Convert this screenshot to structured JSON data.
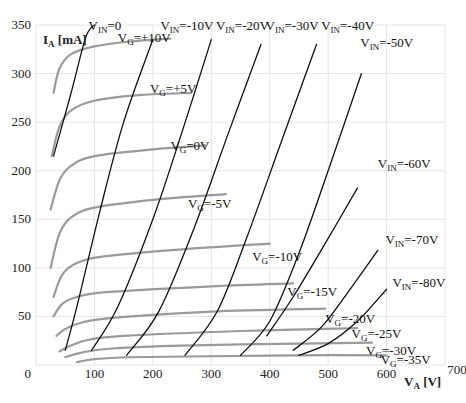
{
  "chart_data": {
    "type": "line",
    "title": "",
    "xlabel": "VA [V]",
    "ylabel": "IA [mA]",
    "xlim": [
      0,
      700
    ],
    "ylim": [
      0,
      350
    ],
    "x_ticks": [
      0,
      100,
      200,
      300,
      400,
      500,
      600,
      700
    ],
    "y_ticks": [
      0,
      50,
      100,
      150,
      200,
      250,
      300,
      350
    ],
    "grid": true,
    "legend": "inline labels",
    "series_groups": {
      "VG_curves": {
        "description": "Anode characteristic curves at constant grid voltage (gray)",
        "color": "#9a9a9a",
        "series": [
          {
            "name": "VG=+10V",
            "label_main": "V",
            "label_sub": "G",
            "label_rest": "=+10V",
            "label_pos": [
              140,
              333
            ],
            "points": [
              [
                30,
                280
              ],
              [
                40,
                305
              ],
              [
                60,
                320
              ],
              [
                100,
                328
              ],
              [
                160,
                333
              ],
              [
                230,
                336
              ]
            ]
          },
          {
            "name": "VG=+5V",
            "label_main": "V",
            "label_sub": "G",
            "label_rest": "=+5V",
            "label_pos": [
              195,
              280
            ],
            "points": [
              [
                27,
                215
              ],
              [
                40,
                245
              ],
              [
                60,
                262
              ],
              [
                100,
                272
              ],
              [
                180,
                278
              ],
              [
                265,
                280
              ]
            ]
          },
          {
            "name": "VG=0V",
            "label_main": "V",
            "label_sub": "G",
            "label_rest": "=0V",
            "label_pos": [
              230,
              221
            ],
            "points": [
              [
                25,
                160
              ],
              [
                40,
                190
              ],
              [
                60,
                205
              ],
              [
                100,
                215
              ],
              [
                200,
                222
              ],
              [
                290,
                226
              ]
            ]
          },
          {
            "name": "VG=-5V",
            "label_main": "V",
            "label_sub": "G",
            "label_rest": "=-5V",
            "label_pos": [
              260,
              162
            ],
            "points": [
              [
                25,
                100
              ],
              [
                40,
                135
              ],
              [
                60,
                152
              ],
              [
                100,
                162
              ],
              [
                200,
                170
              ],
              [
                325,
                176
              ]
            ]
          },
          {
            "name": "VG=-10V",
            "label_main": "V",
            "label_sub": "G",
            "label_rest": "=-10V",
            "label_pos": [
              370,
              107
            ],
            "points": [
              [
                30,
                70
              ],
              [
                45,
                93
              ],
              [
                70,
                105
              ],
              [
                120,
                112
              ],
              [
                250,
                119
              ],
              [
                400,
                125
              ]
            ]
          },
          {
            "name": "VG=-15V",
            "label_main": "V",
            "label_sub": "G",
            "label_rest": "=-15V",
            "label_pos": [
              430,
              71
            ],
            "points": [
              [
                30,
                50
              ],
              [
                45,
                63
              ],
              [
                70,
                70
              ],
              [
                120,
                75
              ],
              [
                300,
                81
              ],
              [
                440,
                84
              ]
            ]
          },
          {
            "name": "VG=-20V",
            "label_main": "V",
            "label_sub": "G",
            "label_rest": "=-20V",
            "label_pos": [
              495,
              43
            ],
            "points": [
              [
                35,
                30
              ],
              [
                50,
                37
              ],
              [
                80,
                44
              ],
              [
                140,
                49
              ],
              [
                300,
                55
              ],
              [
                495,
                58
              ]
            ]
          },
          {
            "name": "VG=-25V",
            "label_main": "V",
            "label_sub": "G",
            "label_rest": "=-25V",
            "label_pos": [
              540,
              28
            ],
            "points": [
              [
                40,
                14
              ],
              [
                60,
                20
              ],
              [
                90,
                26
              ],
              [
                150,
                30
              ],
              [
                350,
                35
              ],
              [
                550,
                38
              ]
            ]
          },
          {
            "name": "VG=-30V",
            "label_main": "V",
            "label_sub": "G",
            "label_rest": "=-30V",
            "label_pos": [
              565,
              10
            ],
            "points": [
              [
                50,
                8
              ],
              [
                80,
                13
              ],
              [
                130,
                17
              ],
              [
                250,
                20
              ],
              [
                450,
                22
              ],
              [
                575,
                23
              ]
            ]
          },
          {
            "name": "VG=-35V",
            "label_main": "V",
            "label_sub": "G",
            "label_rest": "=-35V",
            "label_pos": [
              590,
              1
            ],
            "points": [
              [
                70,
                3
              ],
              [
                100,
                6
              ],
              [
                160,
                8
              ],
              [
                300,
                9
              ],
              [
                450,
                10
              ],
              [
                600,
                10
              ]
            ]
          }
        ]
      },
      "VIN_lines": {
        "description": "Constant input voltage lines (black)",
        "color": "#111111",
        "series": [
          {
            "name": "VIN=0",
            "label_main": "V",
            "label_sub": "IN",
            "label_rest": "=0",
            "label_pos": [
              90,
              345
            ],
            "points": [
              [
                30,
                215
              ],
              [
                60,
                280
              ],
              [
                85,
                337
              ],
              [
                100,
                350
              ]
            ]
          },
          {
            "name": "VIN=-10V",
            "label_main": "V",
            "label_sub": "IN",
            "label_rest": "=-10V",
            "label_pos": [
              213,
              345
            ],
            "points": [
              [
                50,
                15
              ],
              [
                70,
                60
              ],
              [
                110,
                160
              ],
              [
                150,
                250
              ],
              [
                200,
                335
              ]
            ]
          },
          {
            "name": "VIN=-20V",
            "label_main": "V",
            "label_sub": "IN",
            "label_rest": "=-20V",
            "label_pos": [
              308,
              345
            ],
            "points": [
              [
                95,
                15
              ],
              [
                140,
                60
              ],
              [
                200,
                150
              ],
              [
                250,
                240
              ],
              [
                300,
                335
              ]
            ]
          },
          {
            "name": "VIN=-30V",
            "label_main": "V",
            "label_sub": "IN",
            "label_rest": "=-30V",
            "label_pos": [
              393,
              345
            ],
            "points": [
              [
                155,
                10
              ],
              [
                210,
                55
              ],
              [
                270,
                140
              ],
              [
                330,
                240
              ],
              [
                385,
                330
              ]
            ]
          },
          {
            "name": "VIN=-40V",
            "label_main": "V",
            "label_sub": "IN",
            "label_rest": "=-40V",
            "label_pos": [
              488,
              345
            ],
            "points": [
              [
                255,
                10
              ],
              [
                310,
                55
              ],
              [
                360,
                130
              ],
              [
                420,
                230
              ],
              [
                480,
                330
              ]
            ]
          },
          {
            "name": "VIN=-50V",
            "label_main": "V",
            "label_sub": "IN",
            "label_rest": "=-50V",
            "label_pos": [
              555,
              327
            ],
            "points": [
              [
                350,
                10
              ],
              [
                400,
                45
              ],
              [
                450,
                115
              ],
              [
                500,
                200
              ],
              [
                557,
                300
              ]
            ]
          },
          {
            "name": "VIN=-60V",
            "label_main": "V",
            "label_sub": "IN",
            "label_rest": "=-60V",
            "label_pos": [
              585,
              203
            ],
            "points": [
              [
                395,
                30
              ],
              [
                440,
                70
              ],
              [
                490,
                120
              ],
              [
                550,
                182
              ]
            ]
          },
          {
            "name": "VIN=-70V",
            "label_main": "V",
            "label_sub": "IN",
            "label_rest": "=-70V",
            "label_pos": [
              598,
              125
            ],
            "points": [
              [
                440,
                15
              ],
              [
                490,
                40
              ],
              [
                540,
                80
              ],
              [
                585,
                118
              ]
            ]
          },
          {
            "name": "VIN=-80V",
            "label_main": "V",
            "label_sub": "IN",
            "label_rest": "=-80V",
            "label_pos": [
              610,
              80
            ],
            "points": [
              [
                450,
                10
              ],
              [
                500,
                22
              ],
              [
                550,
                45
              ],
              [
                600,
                78
              ]
            ]
          }
        ]
      }
    }
  }
}
